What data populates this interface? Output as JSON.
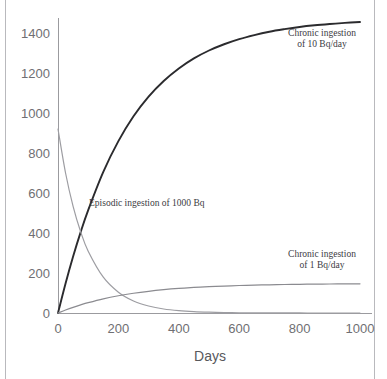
{
  "chart_data": {
    "type": "line",
    "title": "",
    "subtitle": "",
    "xlabel": "Days",
    "ylabel": "",
    "xlim": [
      0,
      1000
    ],
    "ylim": [
      0,
      1500
    ],
    "grid": false,
    "legend_position": "inline-annotations",
    "x_ticks": [
      "0",
      "200",
      "400",
      "600",
      "800",
      "1000"
    ],
    "x_tick_values": [
      0,
      200,
      400,
      600,
      800,
      1000
    ],
    "y_ticks": [
      "0",
      "200",
      "400",
      "600",
      "800",
      "1000",
      "1200",
      "1400"
    ],
    "y_tick_values": [
      0,
      200,
      400,
      600,
      800,
      1000,
      1200,
      1400
    ],
    "x": [
      0,
      25,
      50,
      75,
      100,
      150,
      200,
      250,
      300,
      350,
      400,
      450,
      500,
      550,
      600,
      650,
      700,
      750,
      800,
      850,
      900,
      950,
      1000
    ],
    "series": [
      {
        "name": "Chronic ingestion of 10 Bq/day",
        "color": "#2b2b2e",
        "width": 1.9,
        "values": [
          0,
          160,
          307,
          440,
          560,
          768,
          935,
          1070,
          1177,
          1262,
          1330,
          1385,
          1428,
          1462,
          1490,
          1512,
          1530,
          1544,
          1556,
          1565,
          1572,
          1578,
          1583
        ],
        "plateau": 1455
      },
      {
        "name": "Episodic ingestion of 1000 Bq",
        "color": "#9d9da2",
        "width": 1.2,
        "values": [
          920,
          700,
          533,
          406,
          309,
          179,
          104,
          60,
          35,
          20,
          11.6,
          6.7,
          3.9,
          2.2,
          1.3,
          0.75,
          0.43,
          0.25,
          0.14,
          0.08,
          0.05,
          0.03,
          0.02
        ],
        "initial": 920,
        "half_life_days": 97
      },
      {
        "name": "Chronic ingestion of 1 Bq/day",
        "color": "#8b8b90",
        "width": 1.2,
        "values": [
          0,
          16,
          30.7,
          44,
          56,
          76.8,
          93.5,
          107,
          117.7,
          126.2,
          133,
          138.5,
          142.8,
          146.2,
          149,
          151.2,
          153,
          154.4,
          155.6,
          156.5,
          157.2,
          157.8,
          158.3
        ],
        "plateau": 146
      }
    ],
    "annotations": [
      {
        "id": "annot-chronic-10",
        "lines": [
          "Chronic ingestion",
          "of 10 Bq/day"
        ],
        "x": 322,
        "y": 36
      },
      {
        "id": "annot-episodic",
        "lines": [
          "Episodic ingestion of 1000 Bq"
        ],
        "x": 89,
        "y": 206
      },
      {
        "id": "annot-chronic-1",
        "lines": [
          "Chronic ingestion",
          "of 1 Bq/day"
        ],
        "x": 322,
        "y": 257
      }
    ]
  },
  "axis": {
    "x_title": "Days"
  },
  "colors": {
    "axis_line": "#9b9b9f",
    "tick_text": "#6f6f73",
    "page_rule": "#b9b9bd",
    "background": "#ffffff"
  }
}
